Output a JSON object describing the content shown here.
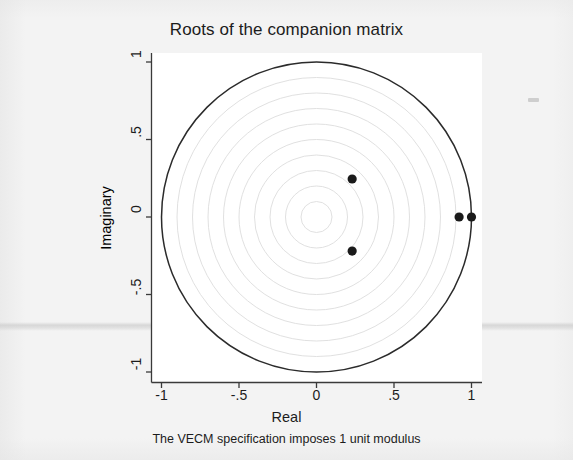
{
  "chart_data": {
    "type": "scatter",
    "title": "Roots of the companion matrix",
    "note": "The VECM specification imposes 1 unit modulus",
    "xlabel": "Real",
    "ylabel": "Imaginary",
    "xlim": [
      -1.07,
      1.07
    ],
    "ylim": [
      -1.07,
      1.07
    ],
    "grid": true,
    "grid_type": "concentric-circles",
    "grid_radii": [
      0.1,
      0.2,
      0.3,
      0.4,
      0.5,
      0.6,
      0.7,
      0.8,
      0.9
    ],
    "unit_circle": true,
    "unit_circle_radius": 1,
    "legend": null,
    "xticks": [
      -1,
      -0.5,
      0,
      0.5,
      1
    ],
    "xtick_labels": [
      "-1",
      "-.5",
      "0",
      ".5",
      "1"
    ],
    "yticks": [
      -1,
      -0.5,
      0,
      0.5,
      1
    ],
    "ytick_labels": [
      "-1",
      "-.5",
      "0",
      ".5",
      "1"
    ],
    "series": [
      {
        "name": "Eigenvalues",
        "marker": "filled-circle",
        "color": "#1a1a1a",
        "points": [
          {
            "real": 1.0,
            "imaginary": 0.0,
            "modulus": 1.0
          },
          {
            "real": 0.92,
            "imaginary": 0.0,
            "modulus": 0.92
          },
          {
            "real": 0.23,
            "imaginary": 0.245,
            "modulus": 0.336
          },
          {
            "real": 0.23,
            "imaginary": -0.22,
            "modulus": 0.318
          }
        ]
      }
    ]
  },
  "axes": {
    "x_title": "Real",
    "y_title": "Imaginary",
    "x_ticks": [
      {
        "label": "-1",
        "value": -1
      },
      {
        "label": "-.5",
        "value": -0.5
      },
      {
        "label": "0",
        "value": 0
      },
      {
        "label": ".5",
        "value": 0.5
      },
      {
        "label": "1",
        "value": 1
      }
    ],
    "y_ticks": [
      {
        "label": "1",
        "value": 1
      },
      {
        "label": ".5",
        "value": 0.5
      },
      {
        "label": "0",
        "value": 0
      },
      {
        "label": "-.5",
        "value": -0.5
      },
      {
        "label": "-1",
        "value": -1
      }
    ]
  },
  "colors": {
    "marker": "#1a1a1a",
    "unit_circle": "#2b2b2b",
    "grid_circle": "#dcdcdc",
    "axis": "#3a3a3a",
    "plot_background": "#ffffff",
    "page_background": "#f3f3f3",
    "text": "#1c1c1c"
  },
  "header": {
    "title": "Roots of the companion matrix"
  },
  "footer": {
    "note": "The VECM specification imposes 1 unit modulus"
  }
}
